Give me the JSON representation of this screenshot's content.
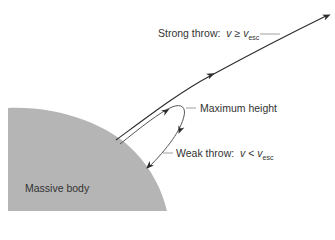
{
  "diagram": {
    "type": "escape-velocity-trajectories",
    "body": {
      "label": "Massive body",
      "fill": "#b5b5b5"
    },
    "labels": {
      "strong_throw": {
        "prefix": "Strong throw:",
        "var": "v",
        "relation": "≥",
        "rhs_var": "v",
        "rhs_sub": "esc"
      },
      "maximum_height": "Maximum height",
      "weak_throw": {
        "prefix": "Weak throw:",
        "var": "v",
        "relation": "<",
        "rhs_var": "v",
        "rhs_sub": "esc"
      }
    },
    "colors": {
      "line": "#2a2a2a",
      "leader": "#888888",
      "text": "#333333"
    }
  }
}
